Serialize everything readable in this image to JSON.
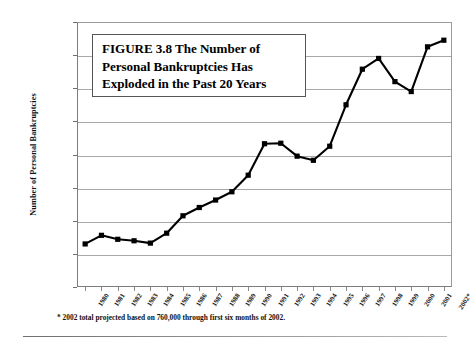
{
  "figure": {
    "title_lines": [
      "FIGURE 3.8  The Number of",
      "Personal Bankruptcies Has",
      "Exploded in the Past 20 Years"
    ],
    "footnote": "* 2002 total projected based on 760,000 through first six months of 2002.",
    "colors": {
      "series": "#000000",
      "gridline": "#a8a8a8",
      "axis": "#7d7d7d",
      "text": "#111111",
      "background": "#ffffff",
      "title_box_border": "#555555"
    }
  },
  "chart_data": {
    "type": "line",
    "title": "FIGURE 3.8  The Number of Personal Bankruptcies Has Exploded in the Past 20 Years",
    "xlabel": "",
    "ylabel": "Number of Personal Bankruptcies",
    "ylim": [
      0,
      1600000
    ],
    "ytick_labels": [
      "1,600,000",
      "1,400,000",
      "1,200,000",
      "1,000,000",
      "800,000",
      "600,000",
      "400,000",
      "200,000",
      "0"
    ],
    "ytick_values": [
      1600000,
      1400000,
      1200000,
      1000000,
      800000,
      600000,
      400000,
      200000,
      0
    ],
    "grid": true,
    "legend": "none",
    "marker": "square",
    "categories": [
      "1980",
      "1981",
      "1982",
      "1983",
      "1984",
      "1985",
      "1986",
      "1987",
      "1988",
      "1989",
      "1990",
      "1991",
      "1992",
      "1993",
      "1994",
      "1995",
      "1996",
      "1997",
      "1998",
      "1999",
      "2000",
      "2001",
      "2002*"
    ],
    "values": [
      260000,
      312000,
      288000,
      279000,
      265000,
      325000,
      430000,
      480000,
      525000,
      575000,
      675000,
      865000,
      868000,
      790000,
      765000,
      850000,
      1100000,
      1315000,
      1380000,
      1240000,
      1180000,
      1450000,
      1490000
    ],
    "series": [
      {
        "name": "Number of Personal Bankruptcies",
        "values": [
          260000,
          312000,
          288000,
          279000,
          265000,
          325000,
          430000,
          480000,
          525000,
          575000,
          675000,
          865000,
          868000,
          790000,
          765000,
          850000,
          1100000,
          1315000,
          1380000,
          1240000,
          1180000,
          1450000,
          1490000
        ]
      }
    ]
  }
}
